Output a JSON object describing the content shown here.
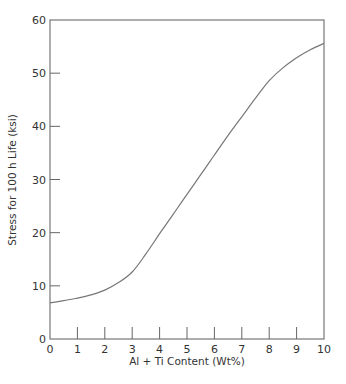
{
  "chart_data": {
    "type": "line",
    "title": "",
    "xlabel": "Al + Ti Content (Wt%)",
    "ylabel": "Stress for 100 h Life (ksi)",
    "xlim": [
      0,
      10
    ],
    "ylim": [
      0,
      60
    ],
    "x_ticks": [
      0,
      1,
      2,
      3,
      4,
      5,
      6,
      7,
      8,
      9,
      10
    ],
    "y_ticks": [
      0,
      10,
      20,
      30,
      40,
      50,
      60
    ],
    "grid": false,
    "legend": null,
    "series": [
      {
        "name": "Stress for 100 h Life",
        "x": [
          0,
          0.5,
          1,
          1.5,
          2,
          2.5,
          3,
          3.5,
          4,
          4.5,
          5,
          5.5,
          6,
          6.5,
          7,
          7.5,
          8,
          8.5,
          9,
          9.5,
          10
        ],
        "y": [
          6.8,
          7.2,
          7.7,
          8.3,
          9.2,
          10.6,
          12.6,
          16.0,
          19.8,
          23.5,
          27.2,
          30.9,
          34.6,
          38.3,
          41.8,
          45.3,
          48.6,
          51.0,
          52.9,
          54.4,
          55.6
        ]
      }
    ]
  },
  "colors": {
    "axis": "#777777",
    "curve": "#777777",
    "text": "#333333",
    "background": "#ffffff"
  }
}
